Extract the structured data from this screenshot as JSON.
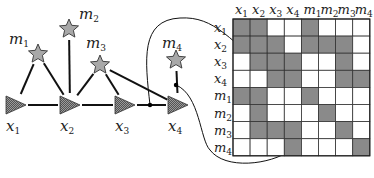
{
  "graph": {
    "robot_nodes": [
      {
        "id": "x1",
        "label": "x",
        "sub": "1",
        "cx": 16,
        "cy": 105
      },
      {
        "id": "x2",
        "label": "x",
        "sub": "2",
        "cx": 70,
        "cy": 105
      },
      {
        "id": "x3",
        "label": "x",
        "sub": "3",
        "cx": 125,
        "cy": 105
      },
      {
        "id": "x4",
        "label": "x",
        "sub": "4",
        "cx": 178,
        "cy": 105
      }
    ],
    "landmark_nodes": [
      {
        "id": "m1",
        "label": "m",
        "sub": "1",
        "cx": 38,
        "cy": 54
      },
      {
        "id": "m2",
        "label": "m",
        "sub": "2",
        "cx": 69,
        "cy": 29
      },
      {
        "id": "m3",
        "label": "m",
        "sub": "3",
        "cx": 100,
        "cy": 65
      },
      {
        "id": "m4",
        "label": "m",
        "sub": "4",
        "cx": 176,
        "cy": 60
      }
    ],
    "edges": [
      [
        "x1",
        "x2"
      ],
      [
        "x2",
        "x3"
      ],
      [
        "x3",
        "x4"
      ],
      [
        "m1",
        "x1"
      ],
      [
        "m1",
        "x2"
      ],
      [
        "m2",
        "x2"
      ],
      [
        "m3",
        "x2"
      ],
      [
        "m3",
        "x3"
      ],
      [
        "m3",
        "x4"
      ],
      [
        "m4",
        "x4"
      ]
    ]
  },
  "matrix": {
    "col_labels": [
      {
        "label": "x",
        "sub": "1"
      },
      {
        "label": "x",
        "sub": "2"
      },
      {
        "label": "x",
        "sub": "3"
      },
      {
        "label": "x",
        "sub": "4"
      },
      {
        "label": "m",
        "sub": "1"
      },
      {
        "label": "m",
        "sub": "2"
      },
      {
        "label": "m",
        "sub": "3"
      },
      {
        "label": "m",
        "sub": "4"
      }
    ],
    "row_labels": [
      {
        "label": "x",
        "sub": "1"
      },
      {
        "label": "x",
        "sub": "2"
      },
      {
        "label": "x",
        "sub": "3"
      },
      {
        "label": "x",
        "sub": "4"
      },
      {
        "label": "m",
        "sub": "1"
      },
      {
        "label": "m",
        "sub": "2"
      },
      {
        "label": "m",
        "sub": "3"
      },
      {
        "label": "m",
        "sub": "4"
      }
    ],
    "cells": [
      [
        1,
        1,
        0,
        0,
        1,
        0,
        0,
        0
      ],
      [
        1,
        1,
        1,
        0,
        1,
        1,
        1,
        0
      ],
      [
        0,
        1,
        1,
        1,
        0,
        0,
        1,
        0
      ],
      [
        0,
        0,
        1,
        1,
        0,
        0,
        1,
        1
      ],
      [
        1,
        1,
        0,
        0,
        1,
        0,
        0,
        0
      ],
      [
        0,
        1,
        0,
        0,
        0,
        1,
        0,
        0
      ],
      [
        0,
        1,
        1,
        1,
        0,
        0,
        1,
        0
      ],
      [
        0,
        0,
        0,
        1,
        0,
        0,
        0,
        1
      ]
    ],
    "filled_color": "#8a8a8a",
    "empty_color": "#ffffff"
  },
  "annotations": [
    {
      "from": "edge x3-x4",
      "to_cell": "x4,x3"
    },
    {
      "from": "edge m4-x4",
      "to_cell": "m4,x4"
    }
  ]
}
